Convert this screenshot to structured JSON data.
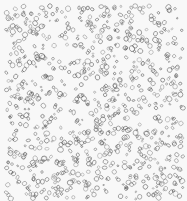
{
  "image": {
    "description": "Texture of many small outlined circles and blobs scattered densely on a light background",
    "width": 187,
    "height": 201,
    "background_color": "#f8f8f8",
    "stroke_color": "#555555",
    "count": 900,
    "seed": 7,
    "margin": {
      "left": 6,
      "top": 6,
      "right": 4,
      "bottom": 2
    },
    "radius_min": 0.8,
    "radius_max": 2.6
  }
}
